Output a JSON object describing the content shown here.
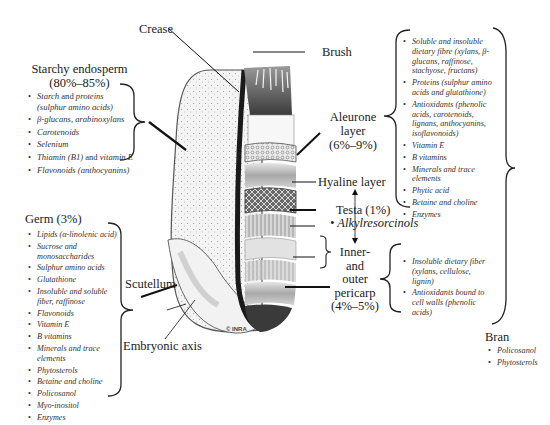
{
  "diagram": {
    "labels": {
      "crease": "Crease",
      "brush": "Brush",
      "starchy_endosperm": "Starchy endosperm",
      "starchy_endosperm_pct": "(80%–85%)",
      "aleurone_line1": "Aleurone",
      "aleurone_line2": "layer",
      "aleurone_pct": "(6%–9%)",
      "hyaline": "Hyaline layer",
      "testa": "Testa (1%)",
      "testa_compound": "Alkylresorcinols",
      "pericarp_line1": "Inner-",
      "pericarp_line2": "and",
      "pericarp_line3": "outer",
      "pericarp_line4": "pericarp",
      "pericarp_pct": "(4%–5%)",
      "germ": "Germ (3%)",
      "scutellum": "Scutellum",
      "embryonic_axis": "Embryonic axis",
      "bran": "Bran",
      "watermark": "© INRA"
    },
    "starchy_endosperm_items": [
      {
        "a": "Starch",
        "b": " and ",
        "c": "proteins",
        "d": "(sulphur amino acids)"
      },
      {
        "a": "β-glucans, arabinoxylans"
      },
      {
        "a": "Carotenoids"
      },
      {
        "a": "Selenium"
      },
      {
        "a": "Thiamin (B1)",
        "b": " and ",
        "c": "vitamin E"
      },
      {
        "a": "Flavonoids (anthocyanins)"
      }
    ],
    "germ_items": [
      "Lipids (α-linolenic acid)",
      "Sucrose and monosaccharides",
      "Sulphur amino acids",
      "Glutathione",
      "Insoluble and soluble fiber, raffinose",
      "Flavonoids",
      "Vitamin E",
      "B vitamins",
      "Minerals and trace elements",
      "Phytosterols",
      "Betaine and choline",
      "Policosanol",
      "Myo-inositol",
      "Enzymes"
    ],
    "aleurone_items": [
      "Soluble and insoluble dietary fibre (xylans, β-glucans, raffinose, stachyose, fructans)",
      "Proteins (sulphur amino acids and glutathione)",
      "Antioxidants (phenolic acids, carotenoids, lignans, anthocyanins, isoflavonoids)",
      "Vitamin E",
      "B vitamins",
      "Minerals and trace elements",
      "Phytic acid",
      "Betaine and choline",
      "Enzymes"
    ],
    "pericarp_items": [
      "Insoluble dietary fiber (xylans, cellulose, lignin)",
      "Antioxidants bound to cell walls (phenolic acids)"
    ],
    "bran_items": [
      "Policosanol",
      "Phytosterols"
    ]
  }
}
